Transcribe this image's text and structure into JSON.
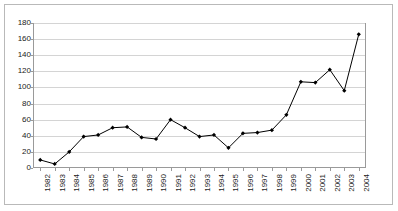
{
  "chart_data": {
    "type": "line",
    "title": "",
    "subtitle": "",
    "xlabel": "",
    "ylabel": "",
    "categories": [
      "1982",
      "1983",
      "1984",
      "1985",
      "1986",
      "1987",
      "1988",
      "1989",
      "1990",
      "1991",
      "1992",
      "1993",
      "1994",
      "1995",
      "1996",
      "1997",
      "1998",
      "1999",
      "2000",
      "2001",
      "2002",
      "2003",
      "2004"
    ],
    "values": [
      10,
      5,
      20,
      39,
      41,
      50,
      51,
      38,
      36,
      60,
      50,
      39,
      41,
      25,
      43,
      44,
      47,
      66,
      107,
      106,
      122,
      96,
      166
    ],
    "series": [
      {
        "name": "",
        "values": [
          10,
          5,
          20,
          39,
          41,
          50,
          51,
          38,
          36,
          60,
          50,
          39,
          41,
          25,
          43,
          44,
          47,
          66,
          107,
          106,
          122,
          96,
          166
        ]
      }
    ],
    "ylim": [
      0,
      180
    ],
    "ytick_step": 20,
    "yticks": [
      0,
      20,
      40,
      60,
      80,
      100,
      120,
      140,
      160,
      180
    ],
    "ytick_labels": [
      "0",
      "20",
      "40",
      "60",
      "80",
      "100",
      "120",
      "140",
      "160",
      "180"
    ],
    "xtick_labels_rotated": true,
    "grid": "horizontal",
    "legend": "none",
    "marker": "filled-diamond",
    "line_color": "#000000",
    "marker_color": "#000000",
    "grid_color": "#d4d4d4",
    "frame_color": "#9a9a9a",
    "plot_background": "#ffffff"
  }
}
